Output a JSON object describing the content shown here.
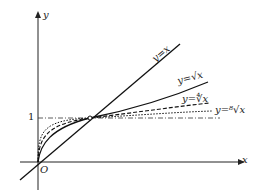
{
  "diagram": {
    "axes": {
      "x_label": "x",
      "y_label": "y",
      "origin_label": "O",
      "tick_y": "1"
    },
    "curves": [
      {
        "label": "y=x",
        "style": "solid"
      },
      {
        "label": "y=√x",
        "style": "solid"
      },
      {
        "label": "y=∜x",
        "style": "dashed"
      },
      {
        "label": "y=⁸√x",
        "style": "dotted"
      }
    ],
    "reference_line": "y=1 dash-dot",
    "intersection_point": "(1,1)"
  }
}
